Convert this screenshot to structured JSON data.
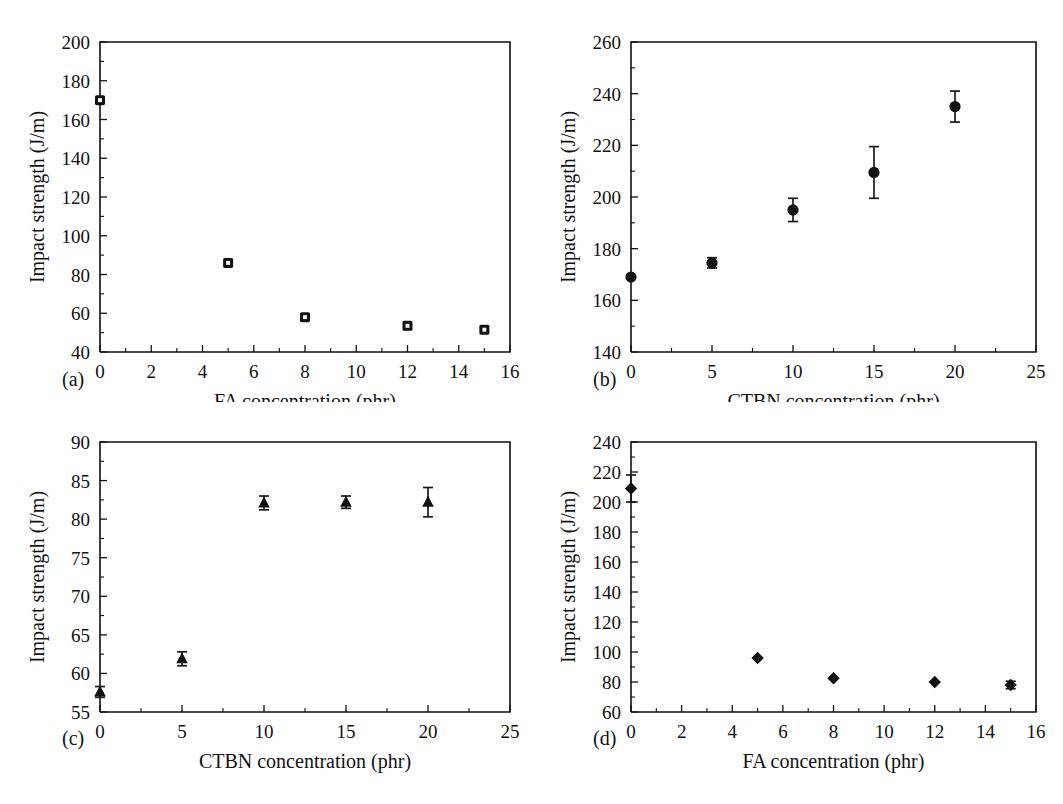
{
  "figure": {
    "panels": [
      {
        "letter": "(a)",
        "marker": "open-square",
        "chart_data": {
          "type": "scatter",
          "title": "",
          "xlabel": "FA concentration (phr)",
          "ylabel": "Impact strength (J/m)",
          "xlim": [
            0,
            16
          ],
          "ylim": [
            40,
            200
          ],
          "xticks": [
            0,
            2,
            4,
            6,
            8,
            10,
            12,
            14,
            16
          ],
          "yticks": [
            40,
            60,
            80,
            100,
            120,
            140,
            160,
            180,
            200
          ],
          "grid": false,
          "legend": "none",
          "x": [
            0,
            5,
            8,
            12,
            15
          ],
          "y": [
            170,
            86,
            58,
            53.5,
            51.5
          ],
          "yerr": [
            0,
            0,
            0,
            0,
            0
          ]
        }
      },
      {
        "letter": "(b)",
        "marker": "filled-circle",
        "chart_data": {
          "type": "scatter",
          "title": "",
          "xlabel": "CTBN concentration (phr)",
          "ylabel": "Impact strength (J/m)",
          "xlim": [
            0,
            25
          ],
          "ylim": [
            140,
            260
          ],
          "xticks": [
            0,
            5,
            10,
            15,
            20,
            25
          ],
          "yticks": [
            140,
            160,
            180,
            200,
            220,
            240,
            260
          ],
          "grid": false,
          "legend": "none",
          "x": [
            0,
            5,
            10,
            15,
            20
          ],
          "y": [
            169,
            174.5,
            195,
            209.5,
            235
          ],
          "yerr": [
            0,
            2,
            4.5,
            10,
            6
          ]
        }
      },
      {
        "letter": "(c)",
        "marker": "filled-triangle",
        "chart_data": {
          "type": "scatter",
          "title": "",
          "xlabel": "CTBN concentration (phr)",
          "ylabel": "Impact strength (J/m)",
          "xlim": [
            0,
            25
          ],
          "ylim": [
            55,
            90
          ],
          "xticks": [
            0,
            5,
            10,
            15,
            20,
            25
          ],
          "yticks": [
            55,
            60,
            65,
            70,
            75,
            80,
            85,
            90
          ],
          "grid": false,
          "legend": "none",
          "x": [
            0,
            5,
            10,
            15,
            20
          ],
          "y": [
            57.6,
            61.9,
            82.1,
            82.2,
            82.2
          ],
          "yerr": [
            0.7,
            0.9,
            0.9,
            0.8,
            1.9
          ]
        }
      },
      {
        "letter": "(d)",
        "marker": "filled-diamond",
        "chart_data": {
          "type": "scatter",
          "title": "",
          "xlabel": "FA concentration (phr)",
          "ylabel": "Impact strength (J/m)",
          "xlim": [
            0,
            16
          ],
          "ylim": [
            60,
            240
          ],
          "xticks": [
            0,
            2,
            4,
            6,
            8,
            10,
            12,
            14,
            16
          ],
          "yticks": [
            60,
            80,
            100,
            120,
            140,
            160,
            180,
            200,
            220,
            240
          ],
          "grid": false,
          "legend": "none",
          "x": [
            0,
            5,
            8,
            12,
            15
          ],
          "y": [
            209,
            96,
            82.5,
            80,
            78
          ],
          "yerr": [
            9,
            0,
            0,
            0,
            2.5
          ]
        }
      }
    ]
  },
  "colors": {
    "axis": "#111111",
    "marker": "#111111",
    "background": "#ffffff"
  }
}
